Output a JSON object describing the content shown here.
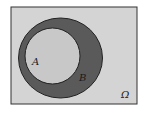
{
  "diagram": {
    "type": "venn",
    "universe_label": "Ω",
    "sets": [
      {
        "name": "A",
        "label": "A",
        "relation": "subset of B"
      },
      {
        "name": "B",
        "label": "B"
      }
    ],
    "colors": {
      "universe_fill": "#d4d4d4",
      "set_b_fill": "#5a5a5a",
      "set_a_fill": "#c8c8c8",
      "border": "#2a2a2a"
    }
  }
}
